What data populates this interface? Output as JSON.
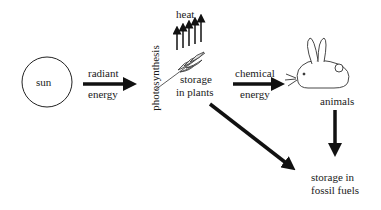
{
  "diagram": {
    "nodes": {
      "sun": "sun",
      "photosynthesis": "photosynthesis",
      "heat": "heat",
      "storage_plants_line1": "storage",
      "storage_plants_line2": "in plants",
      "animals": "animals",
      "storage_fossil_line1": "storage in",
      "storage_fossil_line2": "fossil fuels"
    },
    "edges": {
      "radiant_line1": "radiant",
      "radiant_line2": "energy",
      "chemical_line1": "chemical",
      "chemical_line2": "energy"
    }
  }
}
